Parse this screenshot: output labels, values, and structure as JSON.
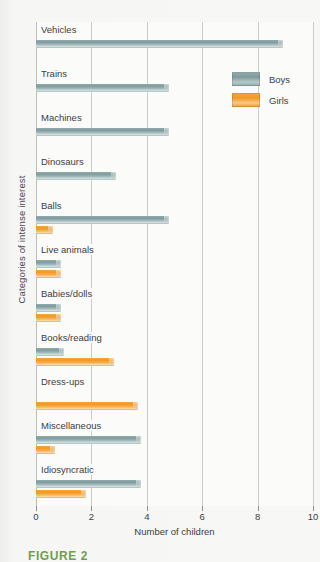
{
  "chart_data": {
    "type": "bar",
    "orientation": "horizontal",
    "title": "",
    "xlabel": "Number of children",
    "ylabel": "Categories of intense interest",
    "xlim": [
      0,
      10
    ],
    "xticks": [
      0,
      2,
      4,
      6,
      8,
      10
    ],
    "grid": true,
    "legend_position": "top-right",
    "categories": [
      "Vehicles",
      "Trains",
      "Machines",
      "Dinosaurs",
      "Balls",
      "Live animals",
      "Babies/dolls",
      "Books/reading",
      "Dress-ups",
      "Miscellaneous",
      "Idiosyncratic"
    ],
    "series": [
      {
        "name": "Boys",
        "color": "#86a2a5",
        "values": [
          8.9,
          4.8,
          4.8,
          2.9,
          4.8,
          0.9,
          0.9,
          1.0,
          0.0,
          3.8,
          3.8
        ]
      },
      {
        "name": "Girls",
        "color": "#f2a436",
        "values": [
          0.0,
          0.0,
          0.0,
          0.0,
          0.6,
          0.9,
          0.9,
          2.8,
          3.7,
          0.7,
          1.8
        ]
      }
    ]
  },
  "legend": {
    "items": [
      {
        "label": "Boys",
        "swatch": "boys-swatch"
      },
      {
        "label": "Girls",
        "swatch": "girls-swatch"
      }
    ]
  },
  "axes": {
    "x_title": "Number of children",
    "y_title": "Categories of intense interest",
    "x_tick_labels": [
      "0",
      "2",
      "4",
      "6",
      "8",
      "10"
    ]
  },
  "caption": {
    "figure_label": "FIGURE 2"
  }
}
